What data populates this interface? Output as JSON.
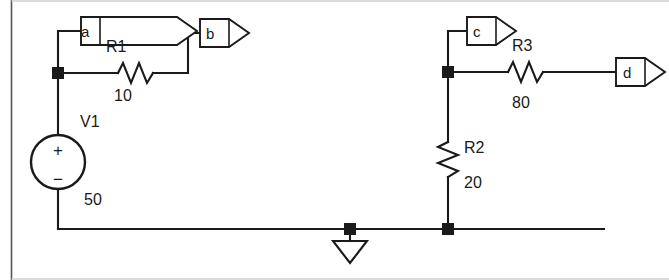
{
  "figure": {
    "kind": "circuit-schematic",
    "background_color": "#ffffff",
    "wire_color": "#1a1a1a",
    "border_color": "#555555",
    "width": 669,
    "height": 280
  },
  "net_flags": [
    {
      "name": "a",
      "label": "a"
    },
    {
      "name": "b",
      "label": "b"
    },
    {
      "name": "c",
      "label": "c"
    },
    {
      "name": "d",
      "label": "d"
    }
  ],
  "components": [
    {
      "ref": "V1",
      "type": "voltage-source",
      "ref_label": "V1",
      "value_label": "50",
      "plus_sign": "+",
      "minus_sign": "−"
    },
    {
      "ref": "R1",
      "type": "resistor",
      "orientation": "horizontal",
      "ref_label": "R1",
      "value_label": "10"
    },
    {
      "ref": "R2",
      "type": "resistor",
      "orientation": "vertical",
      "ref_label": "R2",
      "value_label": "20"
    },
    {
      "ref": "R3",
      "type": "resistor",
      "orientation": "horizontal",
      "ref_label": "R3",
      "value_label": "80"
    }
  ],
  "ground": {
    "name": "ground-symbol",
    "symbol": "earth-triangle"
  },
  "junctions": [
    {
      "name": "junction-node-a"
    },
    {
      "name": "junction-node-c"
    },
    {
      "name": "junction-ground"
    },
    {
      "name": "junction-bottom-right"
    }
  ]
}
